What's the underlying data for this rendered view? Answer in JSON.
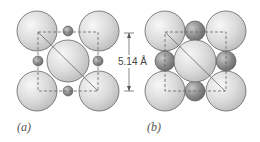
{
  "panels": [
    {
      "label": "(a)",
      "description": "large spheres with small interstitial spheres"
    },
    {
      "label": "(b)",
      "description": "large spheres with medium interstitial spheres touching"
    }
  ],
  "dimension": {
    "text": "5.14 Å"
  },
  "colors": {
    "large": "#dcdcdc",
    "small": "#8a8a8a",
    "edge": "#555555",
    "dash": "#666666"
  }
}
